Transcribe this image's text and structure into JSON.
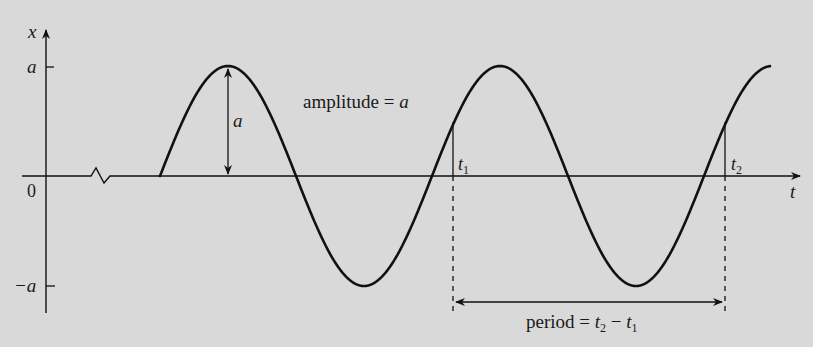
{
  "diagram": {
    "background_color": "#d9d9d9",
    "stroke_color": "#111111",
    "axes": {
      "vertical_label": "x",
      "horizontal_label": "t",
      "origin_label": "0",
      "tick_pos_label": "a",
      "tick_neg_label": "−a"
    },
    "annotations": {
      "amplitude_arrow_label": "a",
      "amplitude_text": "amplitude = ",
      "amplitude_var": "a",
      "t1_label": "t",
      "t1_sub": "1",
      "t2_label": "t",
      "t2_sub": "2",
      "period_text": "period = ",
      "period_t2": "t",
      "period_t2_sub": "2",
      "period_minus": " − ",
      "period_t1": "t",
      "period_t1_sub": "1"
    },
    "wave": {
      "type": "sinusoid",
      "start_phase": "zero crossing (rising)",
      "visible_peaks": 3,
      "visible_troughs": 2,
      "axis_break": "zigzag on t-axis before wave start"
    }
  }
}
